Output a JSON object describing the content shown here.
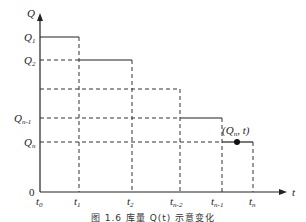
{
  "axes": {
    "y_label": "Q",
    "x_label": "t",
    "origin_label": "0"
  },
  "y_ticks": [
    {
      "base": "Q",
      "sub": "1"
    },
    {
      "base": "Q",
      "sub": "2"
    },
    {
      "base": "Q",
      "sub": "n-1"
    },
    {
      "base": "Q",
      "sub": "n"
    }
  ],
  "x_ticks": [
    {
      "base": "t",
      "sub": "0"
    },
    {
      "base": "t",
      "sub": "1"
    },
    {
      "base": "t",
      "sub": "2"
    },
    {
      "base": "t",
      "sub": "n-2"
    },
    {
      "base": "t",
      "sub": "n-1"
    },
    {
      "base": "t",
      "sub": "n"
    }
  ],
  "point_label": "(Qn, t)",
  "point": {
    "base_open": "(",
    "q": "Q",
    "q_sub": "n",
    "rest": ", t)"
  },
  "caption": "图 1.6  库量 Q(t) 示意变化",
  "colors": {
    "line": "#222222",
    "dashed": "#333333",
    "point": "#111111"
  }
}
